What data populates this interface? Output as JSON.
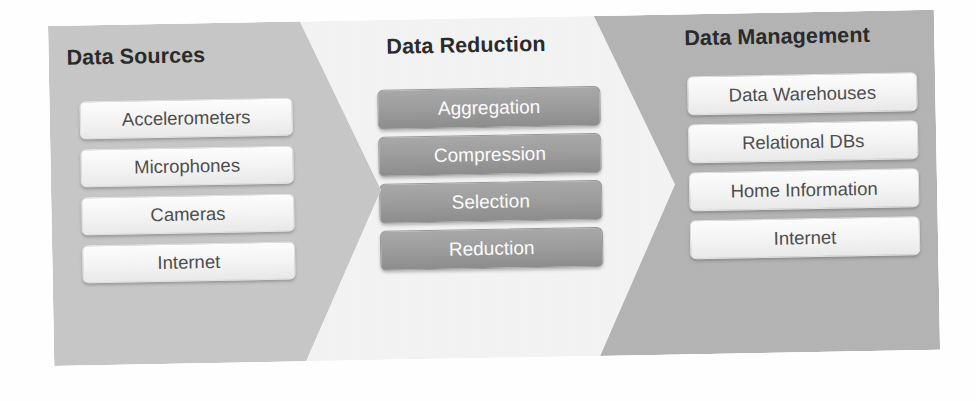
{
  "diagram": {
    "type": "chevron-process-flow",
    "stages": [
      {
        "id": "data-sources",
        "title": "Data Sources",
        "fill": "#c7c7c7",
        "item_style": "light",
        "items": [
          "Accelerometers",
          "Microphones",
          "Cameras",
          "Internet"
        ]
      },
      {
        "id": "data-reduction",
        "title": "Data Reduction",
        "fill": "#f3f3f3",
        "item_style": "dark",
        "items": [
          "Aggregation",
          "Compression",
          "Selection",
          "Reduction"
        ]
      },
      {
        "id": "data-management",
        "title": "Data Management",
        "fill": "#b4b4b4",
        "item_style": "light",
        "items": [
          "Data Warehouses",
          "Relational DBs",
          "Home Information",
          "Internet"
        ]
      }
    ]
  }
}
